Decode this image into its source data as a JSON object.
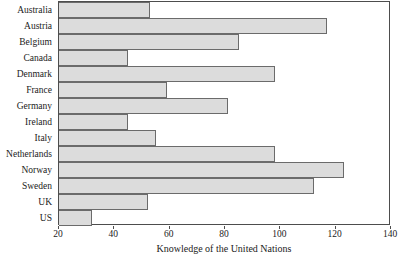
{
  "chart_data": {
    "type": "bar",
    "orientation": "horizontal",
    "title": "",
    "xlabel": "Knowledge of the United Nations",
    "ylabel": "",
    "xlim": [
      20,
      140
    ],
    "xticks": [
      20,
      40,
      60,
      80,
      100,
      120,
      140
    ],
    "grid": false,
    "legend": null,
    "bar_fill_color": "#dcdcdc",
    "bar_edge_color": "#6b6b6b",
    "frame_color": "#4d4d4d",
    "categories": [
      "Australia",
      "Austria",
      "Belgium",
      "Canada",
      "Denmark",
      "France",
      "Germany",
      "Ireland",
      "Italy",
      "Netherlands",
      "Norway",
      "Sweden",
      "UK",
      "US"
    ],
    "values": [
      53,
      117,
      85,
      45,
      98,
      59,
      81,
      45,
      55,
      98,
      123,
      112,
      52,
      32
    ]
  }
}
